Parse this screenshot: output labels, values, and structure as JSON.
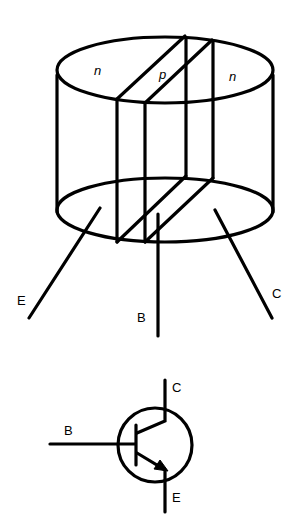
{
  "figure": {
    "cylinder": {
      "regions": [
        {
          "label": "n",
          "role": "emitter region"
        },
        {
          "label": "p",
          "role": "base region"
        },
        {
          "label": "n",
          "role": "collector region"
        }
      ],
      "terminals": [
        {
          "label": "E",
          "name": "emitter"
        },
        {
          "label": "B",
          "name": "base"
        },
        {
          "label": "C",
          "name": "collector"
        }
      ]
    },
    "symbol": {
      "type": "NPN transistor",
      "terminals": [
        {
          "label": "B",
          "name": "base"
        },
        {
          "label": "C",
          "name": "collector"
        },
        {
          "label": "E",
          "name": "emitter"
        }
      ]
    }
  }
}
